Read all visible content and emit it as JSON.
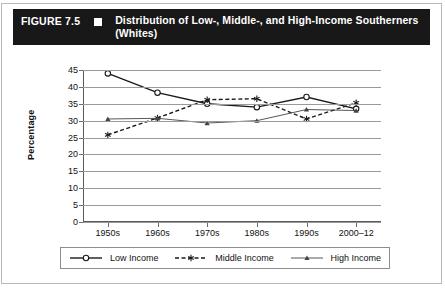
{
  "figure": {
    "number_label": "FIGURE 7.5",
    "marker_icon": "filled-square-icon",
    "title": "Distribution of Low-, Middle-, and High-Income Southerners (Whites)"
  },
  "chart_data": {
    "type": "line",
    "title": "Distribution of Low-, Middle-, and High-Income Southerners (Whites)",
    "xlabel": "",
    "ylabel": "Percentage",
    "categories": [
      "1950s",
      "1960s",
      "1970s",
      "1980s",
      "1990s",
      "2000–12"
    ],
    "yticks": [
      0,
      5,
      10,
      15,
      20,
      25,
      30,
      35,
      40,
      45
    ],
    "ylim": [
      0,
      45
    ],
    "grid": true,
    "legend_position": "bottom",
    "series": [
      {
        "name": "Low Income",
        "marker": "open-circle",
        "line_style": "solid",
        "color": "#1a1a1a",
        "values": [
          44,
          38.3,
          35,
          34,
          37,
          33.5
        ]
      },
      {
        "name": "Middle Income",
        "marker": "asterisk",
        "line_style": "dashed",
        "color": "#1a1a1a",
        "values": [
          25.8,
          30.8,
          36.2,
          36.5,
          30.5,
          35.3
        ]
      },
      {
        "name": "High Income",
        "marker": "filled-triangle",
        "line_style": "solid-thin",
        "color": "#444444",
        "values": [
          30.5,
          30.7,
          29.3,
          30,
          33.3,
          33
        ]
      }
    ]
  },
  "colors": {
    "titlebar_background": "#181818",
    "titlebar_text": "#ffffff",
    "axis": "#5a5a5a",
    "gridline": "#9a9a9a",
    "frame": "#b9b9b9"
  }
}
